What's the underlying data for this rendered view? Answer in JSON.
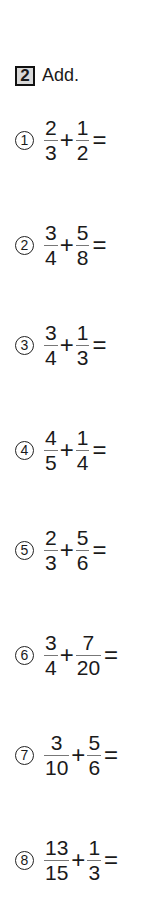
{
  "section": {
    "number": "2",
    "instruction": "Add."
  },
  "problems": [
    {
      "label": "1",
      "a_num": "2",
      "a_den": "3",
      "op": "+",
      "b_num": "1",
      "b_den": "2",
      "eq": "="
    },
    {
      "label": "2",
      "a_num": "3",
      "a_den": "4",
      "op": "+",
      "b_num": "5",
      "b_den": "8",
      "eq": "="
    },
    {
      "label": "3",
      "a_num": "3",
      "a_den": "4",
      "op": "+",
      "b_num": "1",
      "b_den": "3",
      "eq": "="
    },
    {
      "label": "4",
      "a_num": "4",
      "a_den": "5",
      "op": "+",
      "b_num": "1",
      "b_den": "4",
      "eq": "="
    },
    {
      "label": "5",
      "a_num": "2",
      "a_den": "3",
      "op": "+",
      "b_num": "5",
      "b_den": "6",
      "eq": "="
    },
    {
      "label": "6",
      "a_num": "3",
      "a_den": "4",
      "op": "+",
      "b_num": "7",
      "b_den": "20",
      "eq": "="
    },
    {
      "label": "7",
      "a_num": "3",
      "a_den": "10",
      "op": "+",
      "b_num": "5",
      "b_den": "6",
      "eq": "="
    },
    {
      "label": "8",
      "a_num": "13",
      "a_den": "15",
      "op": "+",
      "b_num": "1",
      "b_den": "3",
      "eq": "="
    }
  ]
}
